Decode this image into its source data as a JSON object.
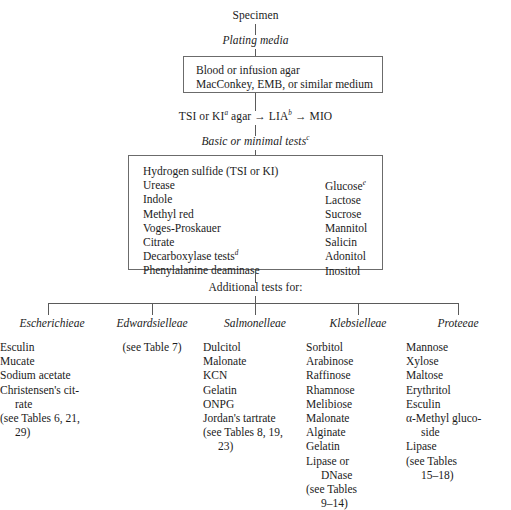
{
  "diagram": {
    "title": "Specimen",
    "steps": {
      "specimen": "Specimen",
      "plating_media": "Plating media",
      "media_box_line1": "Blood or infusion agar",
      "media_box_line2": "MacConkey, EMB, or similar medium",
      "agar_sequence": "TSI or KI",
      "agar_sequence_sup_a": "a",
      "agar_sequence_mid": " agar → LIA",
      "agar_sequence_sup_b": "b",
      "agar_sequence_end": " → MIO",
      "basic_tests": "Basic or minimal tests",
      "basic_tests_sup": "c",
      "additional_tests": "Additional tests for:"
    },
    "tests_box": {
      "left_column": [
        "Hydrogen sulfide (TSI or KI)",
        "Urease",
        "Indole",
        "Methyl red",
        "Voges-Proskauer",
        "Citrate",
        "Decarboxylase tests",
        "Phenylalanine deaminase"
      ],
      "left_column_superscripts": {
        "6": "d"
      },
      "right_column": [
        "Glucose",
        "Lactose",
        "Sucrose",
        "Mannitol",
        "Salicin",
        "Adonitol",
        "Inositol"
      ],
      "right_column_superscripts": {
        "0": "e"
      }
    },
    "columns": [
      {
        "name": "escherichieae",
        "header": "Escherichieae",
        "items": [
          {
            "text": "Esculin",
            "continuation": false
          },
          {
            "text": "Mucate",
            "continuation": false
          },
          {
            "text": "Sodium acetate",
            "continuation": false
          },
          {
            "text": "Christensen's cit-",
            "continuation": false
          },
          {
            "text": "rate",
            "continuation": true
          },
          {
            "text": "(see Tables 6, 21,",
            "continuation": false
          },
          {
            "text": "29)",
            "continuation": true
          }
        ],
        "centered": false
      },
      {
        "name": "edwardsielleae",
        "header": "Edwardsielleae",
        "items": [
          {
            "text": "(see Table 7)",
            "continuation": false
          }
        ],
        "centered": true
      },
      {
        "name": "salmonelleae",
        "header": "Salmonelleae",
        "items": [
          {
            "text": "Dulcitol",
            "continuation": false
          },
          {
            "text": "Malonate",
            "continuation": false
          },
          {
            "text": "KCN",
            "continuation": false
          },
          {
            "text": "Gelatin",
            "continuation": false
          },
          {
            "text": "ONPG",
            "continuation": false
          },
          {
            "text": "Jordan's tartrate",
            "continuation": false
          },
          {
            "text": "(see Tables 8, 19,",
            "continuation": false
          },
          {
            "text": "23)",
            "continuation": true
          }
        ],
        "centered": false
      },
      {
        "name": "klebsielleae",
        "header": "Klebsielleae",
        "items": [
          {
            "text": "Sorbitol",
            "continuation": false
          },
          {
            "text": "Arabinose",
            "continuation": false
          },
          {
            "text": "Raffinose",
            "continuation": false
          },
          {
            "text": "Rhamnose",
            "continuation": false
          },
          {
            "text": "Melibiose",
            "continuation": false
          },
          {
            "text": "Malonate",
            "continuation": false
          },
          {
            "text": "Alginate",
            "continuation": false
          },
          {
            "text": "Gelatin",
            "continuation": false
          },
          {
            "text": "Lipase or",
            "continuation": false
          },
          {
            "text": "DNase",
            "continuation": true
          },
          {
            "text": "(see Tables",
            "continuation": false
          },
          {
            "text": "9–14)",
            "continuation": true
          }
        ],
        "centered": false
      },
      {
        "name": "proteeae",
        "header": "Proteeae",
        "items": [
          {
            "text": "Mannose",
            "continuation": false
          },
          {
            "text": "Xylose",
            "continuation": false
          },
          {
            "text": "Maltose",
            "continuation": false
          },
          {
            "text": "Erythritol",
            "continuation": false
          },
          {
            "text": "Esculin",
            "continuation": false
          },
          {
            "text": "α-Methyl gluco-",
            "continuation": false
          },
          {
            "text": "side",
            "continuation": true
          },
          {
            "text": "Lipase",
            "continuation": false
          },
          {
            "text": "(see Tables",
            "continuation": false
          },
          {
            "text": "15–18)",
            "continuation": true
          }
        ],
        "centered": false
      }
    ],
    "colors": {
      "background": "#ffffff",
      "text": "#1b1b1b",
      "line": "#5a5a5a",
      "box_border": "#6b6b6b"
    }
  }
}
